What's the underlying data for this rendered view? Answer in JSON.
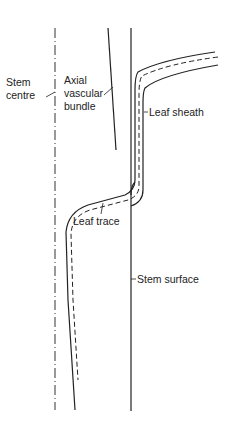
{
  "diagram": {
    "labels": {
      "stem_centre_1": "Stem",
      "stem_centre_2": "centre",
      "axial_1": "Axial",
      "axial_2": "vascular",
      "axial_3": "bundle",
      "leaf_sheath": "Leaf sheath",
      "leaf_trace": "Leaf trace",
      "stem_surface": "Stem surface"
    },
    "colors": {
      "line": "#222222",
      "background": "#ffffff"
    }
  }
}
